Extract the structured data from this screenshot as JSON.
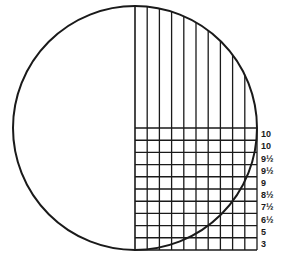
{
  "diagram": {
    "type": "circle-with-grid",
    "stroke_color": "#1a1a1a",
    "background": "#ffffff",
    "circle": {
      "cx": 135,
      "cy": 128,
      "r": 122
    },
    "grid": {
      "x_start": 135,
      "x_end": 257,
      "columns": 10,
      "vertical_top": 6,
      "y_start": 128,
      "y_end": 250,
      "rows": 10
    },
    "row_labels": [
      "10",
      "10",
      "9½",
      "9½",
      "9",
      "8½",
      "7½",
      "6½",
      "5",
      "3"
    ]
  }
}
